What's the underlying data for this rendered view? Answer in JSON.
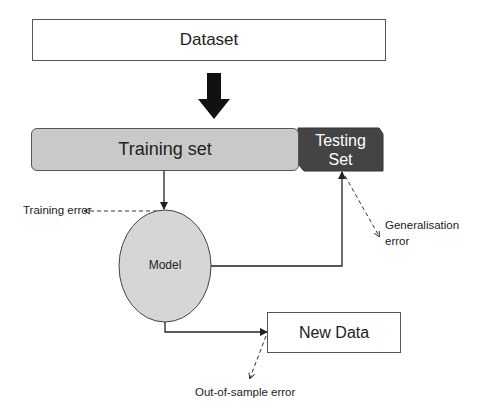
{
  "diagram": {
    "nodes": {
      "dataset": "Dataset",
      "training_set": "Training set",
      "testing_set_line1": "Testing",
      "testing_set_line2": "Set",
      "model": "Model",
      "new_data": "New Data"
    },
    "annotations": {
      "training_error": "Training error",
      "generalisation_error_line1": "Generalisation",
      "generalisation_error_line2": "error",
      "out_of_sample_error": "Out-of-sample error"
    },
    "colors": {
      "training_fill": "#c9c9c9",
      "testing_fill": "#444444",
      "model_fill": "#d6d6d6",
      "stroke": "#222222"
    }
  }
}
